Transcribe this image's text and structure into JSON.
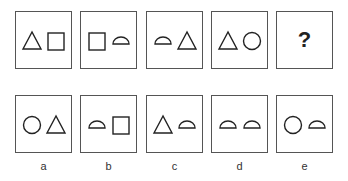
{
  "question_row": [
    {
      "shapes": [
        "triangle",
        "square"
      ]
    },
    {
      "shapes": [
        "square",
        "semicircle"
      ]
    },
    {
      "shapes": [
        "semicircle",
        "triangle"
      ]
    },
    {
      "shapes": [
        "triangle",
        "circle"
      ]
    },
    {
      "placeholder": "?"
    }
  ],
  "answer_row": [
    {
      "label": "a",
      "shapes": [
        "circle",
        "triangle"
      ]
    },
    {
      "label": "b",
      "shapes": [
        "semicircle",
        "square"
      ]
    },
    {
      "label": "c",
      "shapes": [
        "triangle",
        "semicircle"
      ]
    },
    {
      "label": "d",
      "shapes": [
        "semicircle",
        "semicircle"
      ]
    },
    {
      "label": "e",
      "shapes": [
        "circle",
        "semicircle"
      ]
    }
  ],
  "colors": {
    "stroke": "#222222",
    "border": "#555555"
  }
}
